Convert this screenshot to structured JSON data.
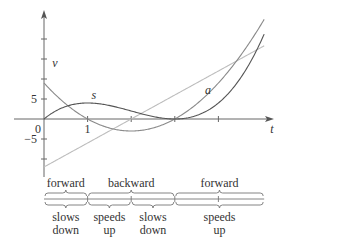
{
  "chart_data": {
    "type": "line",
    "title": "",
    "xlabel": "t",
    "ylabel": "",
    "xlim": [
      0,
      5.05
    ],
    "ylim": [
      -12,
      26
    ],
    "x_ticks": [
      1,
      2,
      3,
      4
    ],
    "x_tick_labels": [
      {
        "value": 0,
        "label": "0"
      },
      {
        "value": 1,
        "label": "1"
      }
    ],
    "y_ticks": [
      -10,
      -5,
      5,
      10,
      15,
      20
    ],
    "y_tick_labels": [
      {
        "value": 5,
        "label": "5"
      },
      {
        "value": -5,
        "label": "−5"
      }
    ],
    "series": [
      {
        "name": "s",
        "formula": "t^3 - 6t^2 + 9t",
        "coefficients": [
          1,
          -6,
          9,
          0
        ],
        "color": "#555555",
        "label_at": [
          1.0,
          4.9
        ]
      },
      {
        "name": "v",
        "formula": "3t^2 - 12t + 9",
        "coefficients": [
          0,
          3,
          -12,
          9
        ],
        "color": "#8a8a8a",
        "label_at": [
          0.1,
          13.0
        ]
      },
      {
        "name": "a",
        "formula": "6t - 12",
        "coefficients": [
          0,
          0,
          6,
          -12
        ],
        "color": "#bdbdbd",
        "label_at": [
          3.6,
          6.3
        ]
      }
    ],
    "grid": false,
    "legend": "none"
  },
  "motion_bar": {
    "direction": [
      {
        "label": "forward",
        "from": 0,
        "to": 1
      },
      {
        "label": "backward",
        "from": 1,
        "to": 3
      },
      {
        "label": "forward",
        "from": 3,
        "to": 5.05
      }
    ],
    "speed": [
      {
        "line1": "slows",
        "line2": "down",
        "from": 0,
        "to": 1
      },
      {
        "line1": "speeds",
        "line2": "up",
        "from": 1,
        "to": 2
      },
      {
        "line1": "slows",
        "line2": "down",
        "from": 2,
        "to": 3
      },
      {
        "line1": "speeds",
        "line2": "up",
        "from": 3,
        "to": 5.05
      }
    ],
    "ticks": [
      1,
      2,
      3,
      4
    ]
  }
}
